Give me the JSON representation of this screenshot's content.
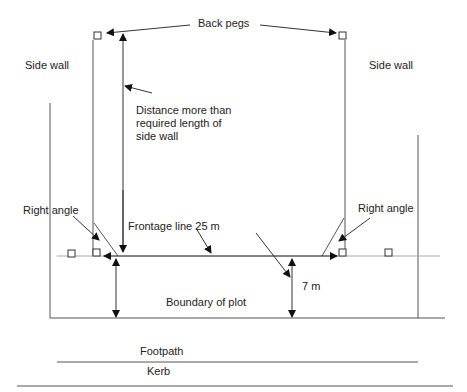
{
  "diagram": {
    "labels": {
      "back_pegs": "Back pegs",
      "side_wall_left": "Side wall",
      "side_wall_right": "Side wall",
      "distance_line1": "Distance more than",
      "distance_line2": "required length of",
      "distance_line3": "side wall",
      "right_angle_left": "Right angle",
      "right_angle_right": "Right angle",
      "frontage_line": "Frontage line 25 m",
      "seven_m": "7 m",
      "boundary": "Boundary of plot",
      "footpath": "Footpath",
      "kerb": "Kerb"
    },
    "colors": {
      "line": "#444444",
      "text": "#222222",
      "faint": "#9a9a9a"
    }
  }
}
